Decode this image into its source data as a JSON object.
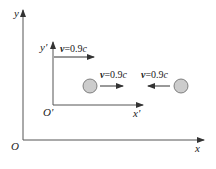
{
  "diagram": {
    "colors": {
      "axis": "#555555",
      "ball_fill": "#cccccc",
      "ball_stroke": "#666666",
      "text": "#222222"
    },
    "frame_S": {
      "origin_label": "O",
      "x_label": "x",
      "y_label": "y"
    },
    "frame_S_prime": {
      "origin_label": "O'",
      "x_label": "x'",
      "y_label": "y'",
      "velocity": {
        "var": "v",
        "eq": "=0.9",
        "unit": "c",
        "direction": "right"
      }
    },
    "balls": [
      {
        "name": "left-ball",
        "velocity": {
          "var": "v",
          "eq": "=0.9",
          "unit": "c",
          "direction": "right"
        }
      },
      {
        "name": "right-ball",
        "velocity": {
          "var": "v",
          "eq": "=0.9",
          "unit": "c",
          "direction": "left"
        }
      }
    ]
  }
}
